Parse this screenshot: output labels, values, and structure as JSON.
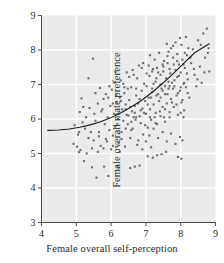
{
  "chart_data": {
    "type": "scatter",
    "title": "",
    "xlabel": "Female overall self-perception",
    "ylabel": "Female overall mate preference",
    "xlim": [
      4,
      9
    ],
    "ylim": [
      3,
      9
    ],
    "xticks": [
      4,
      5,
      6,
      7,
      8,
      9
    ],
    "yticks": [
      3,
      4,
      5,
      6,
      7,
      8,
      9
    ],
    "xtick_labels": [
      "4",
      "5",
      "6",
      "7",
      "8",
      "9"
    ],
    "ytick_labels": [
      "3",
      "4",
      "5",
      "6",
      "7",
      "8",
      "9"
    ],
    "grid": true,
    "grid_color": "#ffffff",
    "panel_color": "#ebebeb",
    "legend": null,
    "point_color": "#6e6e6e",
    "point_size": 2.1,
    "point_shape": "square",
    "curve": {
      "name": "fitted regression curve",
      "color": "#1a1a1a",
      "width": 1.1,
      "x": [
        4.18,
        4.5,
        4.8,
        5.1,
        5.4,
        5.7,
        6.0,
        6.3,
        6.6,
        6.9,
        7.2,
        7.5,
        7.8,
        8.1,
        8.4,
        8.82
      ],
      "y": [
        5.67,
        5.68,
        5.71,
        5.76,
        5.83,
        5.92,
        6.04,
        6.19,
        6.36,
        6.56,
        6.79,
        7.05,
        7.33,
        7.63,
        7.92,
        8.18
      ]
    },
    "points": [
      [
        4.92,
        5.28
      ],
      [
        4.95,
        5.82
      ],
      [
        5.02,
        5.2
      ],
      [
        5.05,
        5.55
      ],
      [
        5.08,
        5.04
      ],
      [
        5.1,
        6.2
      ],
      [
        5.12,
        5.1
      ],
      [
        5.15,
        6.6
      ],
      [
        5.18,
        5.9
      ],
      [
        5.2,
        6.35
      ],
      [
        5.22,
        4.78
      ],
      [
        5.28,
        6.05
      ],
      [
        5.3,
        5.0
      ],
      [
        5.35,
        7.18
      ],
      [
        5.38,
        6.32
      ],
      [
        5.42,
        5.62
      ],
      [
        5.45,
        4.6
      ],
      [
        5.48,
        7.75
      ],
      [
        5.5,
        5.38
      ],
      [
        5.52,
        6.15
      ],
      [
        5.55,
        5.95
      ],
      [
        5.58,
        4.3
      ],
      [
        5.62,
        6.45
      ],
      [
        5.65,
        5.5
      ],
      [
        5.68,
        6.9
      ],
      [
        5.7,
        5.22
      ],
      [
        5.72,
        6.22
      ],
      [
        5.78,
        6.58
      ],
      [
        5.8,
        4.62
      ],
      [
        5.82,
        5.85
      ],
      [
        5.85,
        6.72
      ],
      [
        5.88,
        5.35
      ],
      [
        5.9,
        6.05
      ],
      [
        5.92,
        4.35
      ],
      [
        5.95,
        5.68
      ],
      [
        5.98,
        6.38
      ],
      [
        6.0,
        5.12
      ],
      [
        6.02,
        6.85
      ],
      [
        6.05,
        5.52
      ],
      [
        6.08,
        6.15
      ],
      [
        6.1,
        7.05
      ],
      [
        6.12,
        5.78
      ],
      [
        6.15,
        6.48
      ],
      [
        6.18,
        4.6
      ],
      [
        6.2,
        6.0
      ],
      [
        6.22,
        5.3
      ],
      [
        6.25,
        6.62
      ],
      [
        6.28,
        7.12
      ],
      [
        6.3,
        5.62
      ],
      [
        6.32,
        6.28
      ],
      [
        6.35,
        5.95
      ],
      [
        6.38,
        6.75
      ],
      [
        6.4,
        5.2
      ],
      [
        6.42,
        6.42
      ],
      [
        6.45,
        7.35
      ],
      [
        6.48,
        5.85
      ],
      [
        6.5,
        6.1
      ],
      [
        6.52,
        6.55
      ],
      [
        6.55,
        5.45
      ],
      [
        6.58,
        6.92
      ],
      [
        6.6,
        6.22
      ],
      [
        6.62,
        5.72
      ],
      [
        6.65,
        7.28
      ],
      [
        6.68,
        6.38
      ],
      [
        6.7,
        5.98
      ],
      [
        6.72,
        6.68
      ],
      [
        6.75,
        5.25
      ],
      [
        6.78,
        6.45
      ],
      [
        6.8,
        7.55
      ],
      [
        6.82,
        6.08
      ],
      [
        6.85,
        5.88
      ],
      [
        6.88,
        6.82
      ],
      [
        6.9,
        6.3
      ],
      [
        6.92,
        5.55
      ],
      [
        6.95,
        7.02
      ],
      [
        6.98,
        6.52
      ],
      [
        7.0,
        6.15
      ],
      [
        7.02,
        6.95
      ],
      [
        7.05,
        5.75
      ],
      [
        7.08,
        6.62
      ],
      [
        7.1,
        7.25
      ],
      [
        7.12,
        6.28
      ],
      [
        7.15,
        5.98
      ],
      [
        7.18,
        6.78
      ],
      [
        7.2,
        7.45
      ],
      [
        7.22,
        6.42
      ],
      [
        7.25,
        6.05
      ],
      [
        7.28,
        7.08
      ],
      [
        7.3,
        6.68
      ],
      [
        7.32,
        5.85
      ],
      [
        7.35,
        7.35
      ],
      [
        7.38,
        6.52
      ],
      [
        7.4,
        6.22
      ],
      [
        7.42,
        7.0
      ],
      [
        7.45,
        6.88
      ],
      [
        7.48,
        6.35
      ],
      [
        7.5,
        7.52
      ],
      [
        7.52,
        6.05
      ],
      [
        7.55,
        6.72
      ],
      [
        7.58,
        7.18
      ],
      [
        7.6,
        6.45
      ],
      [
        7.62,
        7.62
      ],
      [
        7.65,
        6.88
      ],
      [
        7.68,
        6.2
      ],
      [
        7.7,
        7.32
      ],
      [
        7.72,
        6.58
      ],
      [
        7.75,
        7.05
      ],
      [
        7.78,
        7.78
      ],
      [
        7.8,
        6.35
      ],
      [
        7.82,
        6.95
      ],
      [
        7.85,
        7.42
      ],
      [
        7.88,
        6.68
      ],
      [
        7.9,
        7.22
      ],
      [
        7.92,
        6.12
      ],
      [
        7.95,
        7.58
      ],
      [
        7.98,
        6.82
      ],
      [
        8.0,
        7.35
      ],
      [
        8.02,
        6.48
      ],
      [
        8.05,
        7.72
      ],
      [
        8.08,
        7.02
      ],
      [
        8.1,
        6.25
      ],
      [
        8.12,
        7.48
      ],
      [
        8.15,
        6.92
      ],
      [
        8.18,
        7.85
      ],
      [
        8.2,
        7.15
      ],
      [
        8.25,
        6.62
      ],
      [
        8.3,
        7.62
      ],
      [
        8.35,
        8.02
      ],
      [
        8.4,
        7.28
      ],
      [
        8.45,
        6.95
      ],
      [
        8.5,
        8.28
      ],
      [
        8.55,
        7.52
      ],
      [
        8.6,
        7.05
      ],
      [
        8.65,
        8.48
      ],
      [
        8.7,
        7.78
      ],
      [
        8.75,
        8.62
      ],
      [
        8.8,
        8.05
      ],
      [
        8.82,
        7.38
      ],
      [
        6.88,
        7.48
      ],
      [
        7.02,
        7.32
      ],
      [
        7.15,
        6.62
      ],
      [
        7.28,
        6.18
      ],
      [
        7.42,
        6.62
      ],
      [
        7.55,
        6.28
      ],
      [
        7.68,
        6.95
      ],
      [
        7.8,
        7.58
      ],
      [
        7.92,
        6.75
      ],
      [
        8.05,
        6.55
      ],
      [
        6.45,
        6.12
      ],
      [
        6.58,
        5.68
      ],
      [
        6.72,
        6.05
      ],
      [
        6.85,
        6.25
      ],
      [
        6.98,
        5.82
      ],
      [
        7.1,
        5.52
      ],
      [
        7.22,
        5.72
      ],
      [
        7.35,
        5.45
      ],
      [
        7.48,
        5.62
      ],
      [
        7.6,
        5.35
      ],
      [
        7.72,
        5.58
      ],
      [
        7.85,
        5.28
      ],
      [
        7.98,
        5.48
      ],
      [
        8.05,
        5.38
      ],
      [
        6.3,
        5.42
      ],
      [
        6.18,
        5.85
      ],
      [
        6.05,
        6.45
      ],
      [
        5.92,
        6.62
      ],
      [
        5.78,
        5.15
      ],
      [
        5.62,
        5.05
      ],
      [
        7.05,
        4.92
      ],
      [
        7.2,
        4.88
      ],
      [
        7.32,
        4.95
      ],
      [
        6.82,
        4.65
      ],
      [
        7.45,
        4.98
      ],
      [
        6.55,
        4.58
      ],
      [
        6.68,
        4.62
      ],
      [
        7.58,
        5.05
      ],
      [
        7.92,
        4.9
      ],
      [
        8.02,
        4.85
      ],
      [
        7.12,
        7.85
      ],
      [
        7.25,
        7.72
      ],
      [
        7.38,
        7.92
      ],
      [
        7.52,
        7.68
      ],
      [
        7.65,
        7.95
      ],
      [
        7.78,
        8.12
      ],
      [
        7.9,
        7.88
      ],
      [
        8.02,
        8.15
      ],
      [
        8.12,
        7.92
      ],
      [
        8.22,
        8.05
      ],
      [
        6.92,
        7.62
      ],
      [
        6.75,
        7.18
      ],
      [
        6.62,
        7.42
      ],
      [
        6.48,
        6.88
      ],
      [
        6.35,
        7.02
      ],
      [
        7.48,
        6.82
      ],
      [
        7.62,
        6.72
      ],
      [
        7.75,
        6.48
      ],
      [
        7.88,
        6.42
      ],
      [
        8.0,
        6.18
      ],
      [
        7.05,
        6.42
      ],
      [
        7.18,
        6.88
      ],
      [
        7.3,
        7.18
      ],
      [
        7.42,
        7.28
      ],
      [
        7.55,
        6.95
      ],
      [
        7.68,
        7.45
      ],
      [
        7.82,
        7.12
      ],
      [
        7.95,
        7.25
      ],
      [
        8.08,
        7.58
      ],
      [
        8.18,
        7.32
      ],
      [
        6.95,
        6.18
      ],
      [
        6.82,
        6.58
      ],
      [
        6.68,
        6.18
      ],
      [
        6.55,
        6.35
      ],
      [
        6.42,
        5.72
      ],
      [
        7.98,
        8.35
      ],
      [
        7.85,
        8.22
      ],
      [
        7.72,
        8.05
      ],
      [
        7.6,
        8.18
      ],
      [
        8.28,
        7.78
      ],
      [
        5.35,
        5.45
      ],
      [
        5.55,
        6.75
      ],
      [
        5.75,
        6.28
      ],
      [
        5.95,
        6.95
      ],
      [
        6.15,
        6.68
      ],
      [
        5.08,
        5.62
      ],
      [
        5.25,
        5.72
      ],
      [
        5.45,
        5.15
      ],
      [
        5.65,
        5.62
      ],
      [
        5.85,
        5.42
      ],
      [
        6.25,
        5.05
      ],
      [
        6.05,
        5.22
      ],
      [
        6.38,
        6.92
      ],
      [
        6.52,
        7.22
      ],
      [
        6.65,
        6.05
      ],
      [
        7.08,
        7.55
      ],
      [
        7.22,
        7.02
      ],
      [
        7.35,
        6.72
      ],
      [
        7.5,
        7.38
      ],
      [
        7.65,
        7.08
      ],
      [
        7.78,
        6.88
      ],
      [
        7.9,
        7.68
      ],
      [
        8.0,
        6.92
      ],
      [
        8.1,
        7.05
      ],
      [
        8.2,
        6.75
      ],
      [
        7.0,
        5.35
      ],
      [
        7.15,
        5.18
      ],
      [
        6.9,
        5.12
      ],
      [
        6.78,
        5.38
      ],
      [
        8.08,
        6.05
      ],
      [
        7.55,
        5.92
      ],
      [
        7.68,
        6.05
      ],
      [
        7.42,
        6.08
      ],
      [
        7.28,
        5.88
      ],
      [
        7.12,
        6.05
      ],
      [
        8.38,
        7.45
      ],
      [
        8.48,
        7.15
      ],
      [
        8.58,
        8.15
      ],
      [
        8.68,
        7.35
      ],
      [
        8.78,
        7.92
      ],
      [
        6.12,
        7.38
      ],
      [
        6.28,
        6.52
      ],
      [
        6.42,
        6.28
      ],
      [
        6.58,
        5.92
      ],
      [
        6.72,
        6.88
      ],
      [
        7.62,
        7.82
      ],
      [
        7.48,
        7.58
      ],
      [
        7.32,
        7.48
      ],
      [
        7.18,
        7.38
      ],
      [
        8.15,
        8.38
      ]
    ]
  }
}
